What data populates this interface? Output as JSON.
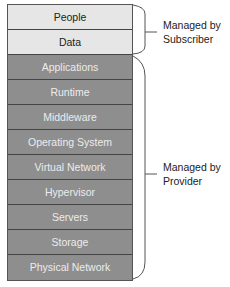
{
  "diagram": {
    "subscriber_layers": [
      "People",
      "Data"
    ],
    "provider_layers": [
      "Applications",
      "Runtime",
      "Middleware",
      "Operating System",
      "Virtual Network",
      "Hypervisor",
      "Servers",
      "Storage",
      "Physical Network"
    ],
    "labels": {
      "subscriber": {
        "line1": "Managed by",
        "line2": "Subscriber"
      },
      "provider": {
        "line1": "Managed by",
        "line2": "Provider"
      }
    },
    "colors": {
      "subscriber_fill": "#e6e6e6",
      "provider_fill": "#8e8e8e"
    }
  }
}
